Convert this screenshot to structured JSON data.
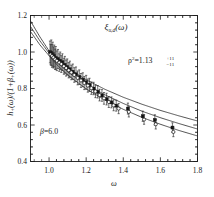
{
  "figure": {
    "title": "ξ",
    "title_sub": "u,d",
    "title_arg": "(ω)",
    "xlabel": "ω",
    "ylabel_parts": {
      "h": "h",
      "h_sub": "+",
      "h_arg": "(ω)",
      "slash": "/(1+",
      "beta": "β",
      "beta_sub": "+",
      "beta_arg": "(ω))"
    },
    "annotation_rho": {
      "symbol": "ρ",
      "exponent": "2",
      "equals": "=1.13",
      "err_up": "+11",
      "err_dn": "−11"
    },
    "annotation_beta": {
      "symbol": "β",
      "value": "=6.0"
    }
  },
  "chart_data": {
    "type": "scatter",
    "xlabel": "ω",
    "ylabel": "h_{+}(ω)/(1+β_{+}(ω))",
    "xlim": [
      0.9,
      1.8
    ],
    "ylim": [
      0.4,
      1.2
    ],
    "xticks": [
      "1.0",
      "1.2",
      "1.4",
      "1.6",
      "1.8"
    ],
    "xtick_values": [
      1.0,
      1.2,
      1.4,
      1.6,
      1.8
    ],
    "yticks": [
      "0.4",
      "0.6",
      "0.8",
      "1.0",
      "1.2"
    ],
    "ytick_values": [
      0.4,
      0.6,
      0.8,
      1.0,
      1.2
    ],
    "xminor_per_interval": 4,
    "yminor_per_interval": 4,
    "grid": false,
    "legend": false,
    "annotations": [
      {
        "text": "ρ²=1.13 +11 −11",
        "x": 1.48,
        "y": 0.93
      },
      {
        "text": "β=6.0",
        "x": 1.04,
        "y": 0.6
      }
    ],
    "series": [
      {
        "name": "lattice-data-filled-square",
        "marker": "filled-square",
        "x": [
          1.005,
          1.012,
          1.02,
          1.028,
          1.036,
          1.048,
          1.06,
          1.072,
          1.085,
          1.098,
          1.112,
          1.128,
          1.145,
          1.163,
          1.182,
          1.2,
          1.218,
          1.24,
          1.262,
          1.285,
          1.31,
          1.336,
          1.362,
          1.425,
          1.505,
          1.57,
          1.665
        ],
        "y": [
          1.0,
          0.996,
          0.988,
          0.978,
          0.968,
          0.962,
          0.952,
          0.944,
          0.93,
          0.918,
          0.906,
          0.892,
          0.878,
          0.862,
          0.848,
          0.834,
          0.82,
          0.8,
          0.782,
          0.762,
          0.742,
          0.724,
          0.706,
          0.69,
          0.648,
          0.628,
          0.586
        ],
        "yerr": [
          0.06,
          0.07,
          0.066,
          0.06,
          0.062,
          0.052,
          0.048,
          0.046,
          0.046,
          0.044,
          0.044,
          0.042,
          0.04,
          0.04,
          0.038,
          0.038,
          0.036,
          0.034,
          0.034,
          0.032,
          0.032,
          0.03,
          0.03,
          0.03,
          0.028,
          0.028,
          0.026
        ]
      },
      {
        "name": "lattice-data-open-circle",
        "marker": "open-circle",
        "x": [
          1.008,
          1.016,
          1.024,
          1.033,
          1.042,
          1.055,
          1.066,
          1.08,
          1.092,
          1.106,
          1.12,
          1.136,
          1.154,
          1.172,
          1.19,
          1.209,
          1.228,
          1.25,
          1.272,
          1.296,
          1.322,
          1.348,
          1.375,
          1.43,
          1.512,
          1.575,
          1.67
        ],
        "y": [
          0.986,
          0.978,
          0.97,
          0.96,
          0.952,
          0.942,
          0.934,
          0.922,
          0.912,
          0.9,
          0.888,
          0.874,
          0.858,
          0.844,
          0.83,
          0.816,
          0.802,
          0.784,
          0.764,
          0.746,
          0.726,
          0.708,
          0.69,
          0.672,
          0.63,
          0.604,
          0.562
        ],
        "yerr": [
          0.056,
          0.062,
          0.058,
          0.056,
          0.054,
          0.048,
          0.046,
          0.044,
          0.044,
          0.042,
          0.04,
          0.04,
          0.038,
          0.038,
          0.036,
          0.036,
          0.034,
          0.034,
          0.032,
          0.032,
          0.03,
          0.03,
          0.028,
          0.028,
          0.026,
          0.026,
          0.026
        ]
      }
    ],
    "fit_curves": [
      {
        "name": "fit-upper",
        "rho2": 1.02,
        "x": [
          0.9,
          0.95,
          1.0,
          1.05,
          1.1,
          1.2,
          1.3,
          1.4,
          1.5,
          1.6,
          1.7,
          1.8
        ],
        "y": [
          1.17,
          1.084,
          1.006,
          0.952,
          0.912,
          0.848,
          0.796,
          0.752,
          0.714,
          0.68,
          0.65,
          0.622
        ]
      },
      {
        "name": "fit-central",
        "rho2": 1.13,
        "x": [
          0.9,
          0.95,
          1.0,
          1.05,
          1.1,
          1.2,
          1.3,
          1.4,
          1.5,
          1.6,
          1.7,
          1.8
        ],
        "y": [
          1.14,
          1.062,
          0.994,
          0.938,
          0.892,
          0.822,
          0.766,
          0.718,
          0.676,
          0.64,
          0.608,
          0.578
        ]
      },
      {
        "name": "fit-lower",
        "rho2": 1.24,
        "x": [
          0.9,
          0.95,
          1.0,
          1.05,
          1.1,
          1.2,
          1.3,
          1.4,
          1.5,
          1.6,
          1.7,
          1.8
        ],
        "y": [
          1.112,
          1.04,
          0.98,
          0.922,
          0.874,
          0.798,
          0.738,
          0.686,
          0.642,
          0.604,
          0.57,
          0.54
        ]
      }
    ]
  }
}
